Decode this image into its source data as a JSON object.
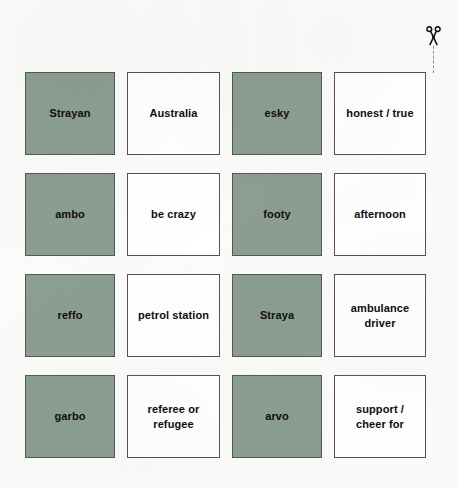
{
  "sheet": {
    "title": "Australian Slang Flashcards",
    "cut_marker": {
      "icon": "scissors-icon",
      "label": "✂",
      "line_style": "dashed"
    },
    "colors": {
      "term_card_fill": "#8b9e91",
      "definition_card_fill": "#ffffff",
      "card_border": "#545454",
      "page_background": "#fbfbfa",
      "text": "#0e0e0e",
      "cut_line": "#8d8d8d"
    },
    "grid": {
      "columns": 4,
      "rows": 4
    },
    "cards": [
      {
        "text": "Strayan",
        "type": "term"
      },
      {
        "text": "Australia",
        "type": "definition"
      },
      {
        "text": "esky",
        "type": "term"
      },
      {
        "text": "honest / true",
        "type": "definition"
      },
      {
        "text": "ambo",
        "type": "term"
      },
      {
        "text": "be crazy",
        "type": "definition"
      },
      {
        "text": "footy",
        "type": "term"
      },
      {
        "text": "afternoon",
        "type": "definition"
      },
      {
        "text": "reffo",
        "type": "term"
      },
      {
        "text": "petrol station",
        "type": "definition"
      },
      {
        "text": "Straya",
        "type": "term"
      },
      {
        "text": "ambulance\ndriver",
        "type": "definition"
      },
      {
        "text": "garbo",
        "type": "term"
      },
      {
        "text": "referee or\nrefugee",
        "type": "definition"
      },
      {
        "text": "arvo",
        "type": "term"
      },
      {
        "text": "support /\ncheer for",
        "type": "definition"
      }
    ]
  }
}
